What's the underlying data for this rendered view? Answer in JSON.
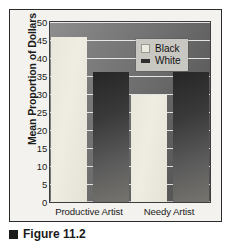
{
  "figure": {
    "caption": "Figure 11.2",
    "caption_marker_icon": "square-bullet-icon"
  },
  "chart_data": {
    "type": "bar",
    "title": "",
    "subtitle": "",
    "xlabel": "",
    "ylabel": "Mean Proportion of Dollars",
    "categories": [
      "Productive Artist",
      "Needy Artist"
    ],
    "series": [
      {
        "name": "Black",
        "values": [
          45.7,
          29.7
        ],
        "color": "#ece9de"
      },
      {
        "name": "White",
        "values": [
          36.0,
          36.0
        ],
        "color": "#2e2e2e"
      }
    ],
    "ylim": [
      0,
      50
    ],
    "ytick_step": 5,
    "yticks": [
      50,
      45,
      40,
      35,
      30,
      25,
      20,
      15,
      10,
      5,
      0
    ],
    "ytick_labels": [
      "50",
      "45",
      "40",
      "35",
      "30",
      "25",
      "20",
      "15",
      "10",
      "5",
      "0"
    ],
    "grid": true,
    "grid_axis": "y",
    "grid_color": "#ffffff",
    "legend_position": "upper center",
    "legend_entries": [
      "Black",
      "White"
    ],
    "plot_background": "#6e6e6e",
    "figure_background": "#f3f2ee",
    "bar_group_order": [
      "Black",
      "White"
    ]
  }
}
